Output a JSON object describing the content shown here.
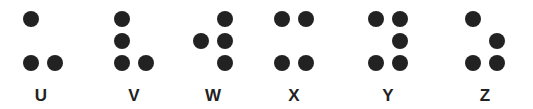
{
  "dot_color": "#222222",
  "letters": [
    {
      "label": "U",
      "x": 23,
      "dots": [
        1,
        3,
        6
      ]
    },
    {
      "label": "V",
      "x": 114,
      "dots": [
        1,
        2,
        3,
        6
      ]
    },
    {
      "label": "W",
      "x": 193,
      "dots": [
        2,
        4,
        5,
        6
      ]
    },
    {
      "label": "X",
      "x": 274,
      "dots": [
        1,
        3,
        4,
        6
      ]
    },
    {
      "label": "Y",
      "x": 368,
      "dots": [
        1,
        3,
        4,
        5,
        6
      ]
    },
    {
      "label": "Z",
      "x": 465,
      "dots": [
        1,
        3,
        5,
        6
      ]
    }
  ]
}
